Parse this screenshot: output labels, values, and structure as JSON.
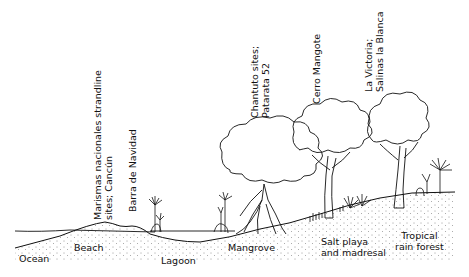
{
  "diagram": {
    "type": "coastal-cross-section",
    "zones": [
      {
        "id": "ocean",
        "label": "Ocean"
      },
      {
        "id": "beach",
        "label": "Beach"
      },
      {
        "id": "lagoon",
        "label": "Lagoon"
      },
      {
        "id": "mangrove",
        "label": "Mangrove"
      },
      {
        "id": "salt-playa",
        "label_line1": "Salt playa",
        "label_line2": "and madresal"
      },
      {
        "id": "rain-forest",
        "label_line1": "Tropical",
        "label_line2": "rain forest"
      }
    ],
    "sites": [
      {
        "id": "marismas",
        "line1": "Marismas nacionales strandline",
        "line2": "sites; Cancún"
      },
      {
        "id": "barra",
        "line1": "Barra  de  Navidad"
      },
      {
        "id": "chantuto",
        "line1": "Chantuto sites;",
        "line2": "Patarata  52"
      },
      {
        "id": "cerro",
        "line1": "Cerro  Mangote"
      },
      {
        "id": "victoria",
        "line1": "La  Victoria;",
        "line2": "Salinas  la  Blanca"
      }
    ],
    "colors": {
      "ink": "#111111",
      "background": "#ffffff"
    }
  }
}
